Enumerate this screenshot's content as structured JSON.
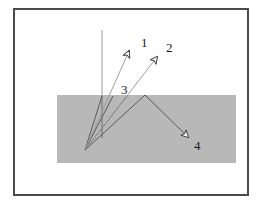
{
  "figure": {
    "background_color": "#ffffff",
    "frame": {
      "name": "outer-frame",
      "x": 14,
      "y": 9,
      "width": 234,
      "height": 186,
      "stroke_color": "#4a4a4a",
      "stroke_width": 2
    },
    "surface": {
      "name": "gray-medium-slab",
      "x": 57,
      "y": 95,
      "width": 179,
      "height": 68,
      "fill_color": "#b8b8b8"
    },
    "normal_line": {
      "name": "surface-normal",
      "x1": 102,
      "y1": 30,
      "x2": 102,
      "y2": 96,
      "stroke_color": "#9a9a9a",
      "stroke_width": 1
    },
    "origin_point": {
      "x": 85,
      "y": 150
    },
    "surface_apex": {
      "x": 145,
      "y": 95
    },
    "rays": [
      {
        "label": "1",
        "name": "ray-1",
        "x1": 85,
        "y1": 150,
        "x2": 129,
        "y2": 51,
        "stroke_color": "#9e9e9e",
        "stroke_width": 1,
        "arrowhead": "hollow",
        "label_x": 141,
        "label_y": 36
      },
      {
        "label": "2",
        "name": "ray-2",
        "x1": 85,
        "y1": 150,
        "x2": 157,
        "y2": 57,
        "stroke_color": "#9e9e9e",
        "stroke_width": 1,
        "arrowhead": "hollow",
        "label_x": 166,
        "label_y": 41
      },
      {
        "label": "3",
        "name": "ray-3",
        "x1": 85,
        "y1": 150,
        "x2": 145,
        "y2": 95,
        "stroke_color": "#5a5a5a",
        "stroke_width": 1,
        "arrowhead": "none",
        "label_x": 121,
        "label_y": 83
      },
      {
        "label": "4",
        "name": "ray-4",
        "x1": 145,
        "y1": 95,
        "x2": 188,
        "y2": 137,
        "stroke_color": "#5a5a5a",
        "stroke_width": 1,
        "arrowhead": "hollow",
        "label_x": 194,
        "label_y": 139
      }
    ],
    "extra_rays": [
      {
        "name": "ray-fan-a",
        "x1": 85,
        "y1": 150,
        "x2": 102,
        "y2": 96,
        "stroke_color": "#5a5a5a",
        "stroke_width": 1
      },
      {
        "name": "ray-fan-b",
        "x1": 85,
        "y1": 150,
        "x2": 113,
        "y2": 96,
        "stroke_color": "#5a5a5a",
        "stroke_width": 1
      },
      {
        "name": "ray-fan-c",
        "x1": 85,
        "y1": 150,
        "x2": 127,
        "y2": 96,
        "stroke_color": "#5a5a5a",
        "stroke_width": 1
      },
      {
        "name": "ray-fan-vertical-drop",
        "x1": 102,
        "y1": 96,
        "x2": 102,
        "y2": 138,
        "stroke_color": "#6a6a6a",
        "stroke_width": 1
      }
    ]
  }
}
